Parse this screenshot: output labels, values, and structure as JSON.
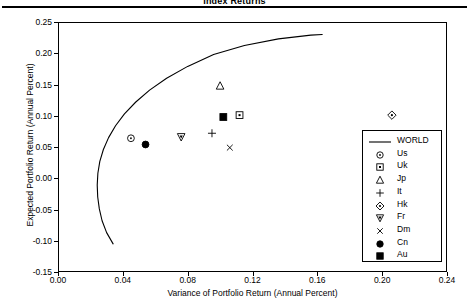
{
  "header": {
    "title": "Index Returns",
    "rule": true
  },
  "chart_data": {
    "type": "scatter",
    "title": "Index Returns",
    "xlabel": "Variance of Portfolio Return (Annual Percent)",
    "ylabel": "Expected Portfolio Return (Annual Percent)",
    "xlim": [
      0.0,
      0.24
    ],
    "ylim": [
      -0.15,
      0.25
    ],
    "xticks": [
      "0.00",
      "0.04",
      "0.08",
      "0.12",
      "0.16",
      "0.20",
      "0.24"
    ],
    "xtick_values": [
      0.0,
      0.04,
      0.08,
      0.12,
      0.16,
      0.2,
      0.24
    ],
    "yticks": [
      "0.25",
      "0.20",
      "0.15",
      "0.10",
      "0.05",
      "0.00",
      "-0.05",
      "-0.10",
      "-0.15"
    ],
    "ytick_values": [
      0.25,
      0.2,
      0.15,
      0.1,
      0.05,
      0.0,
      -0.05,
      -0.1,
      -0.15
    ],
    "grid": false,
    "legend_position": "right-inside",
    "series": [
      {
        "name": "WORLD",
        "marker": "line",
        "type": "curve",
        "note": "efficient frontier hyperbola",
        "points": [
          [
            0.034,
            -0.105
          ],
          [
            0.03,
            -0.087
          ],
          [
            0.0272,
            -0.068
          ],
          [
            0.0255,
            -0.049
          ],
          [
            0.0245,
            -0.03
          ],
          [
            0.0242,
            -0.011
          ],
          [
            0.0246,
            0.008
          ],
          [
            0.0258,
            0.027
          ],
          [
            0.028,
            0.046
          ],
          [
            0.0312,
            0.065
          ],
          [
            0.0355,
            0.084
          ],
          [
            0.041,
            0.103
          ],
          [
            0.048,
            0.122
          ],
          [
            0.0565,
            0.141
          ],
          [
            0.067,
            0.16
          ],
          [
            0.08,
            0.179
          ],
          [
            0.096,
            0.198
          ],
          [
            0.115,
            0.2125
          ],
          [
            0.136,
            0.223
          ],
          [
            0.156,
            0.229
          ],
          [
            0.163,
            0.23
          ]
        ]
      },
      {
        "name": "Us",
        "marker": "circle-dot",
        "x": 0.045,
        "y": 0.064
      },
      {
        "name": "Uk",
        "marker": "square-dot",
        "x": 0.112,
        "y": 0.101
      },
      {
        "name": "Jp",
        "marker": "triangle-up",
        "x": 0.1,
        "y": 0.148
      },
      {
        "name": "It",
        "marker": "plus",
        "x": 0.095,
        "y": 0.072
      },
      {
        "name": "Hk",
        "marker": "diamond-dot",
        "x": 0.206,
        "y": 0.101
      },
      {
        "name": "Fr",
        "marker": "triangle-down-dot",
        "x": 0.076,
        "y": 0.066
      },
      {
        "name": "Dm",
        "marker": "cross",
        "x": 0.106,
        "y": 0.049
      },
      {
        "name": "Cn",
        "marker": "filled-circle",
        "x": 0.054,
        "y": 0.054
      },
      {
        "name": "Au",
        "marker": "filled-square",
        "x": 0.102,
        "y": 0.098
      }
    ],
    "legend_entries": [
      {
        "label": "WORLD",
        "marker": "line"
      },
      {
        "label": "Us",
        "marker": "circle-dot"
      },
      {
        "label": "Uk",
        "marker": "square-dot"
      },
      {
        "label": "Jp",
        "marker": "triangle-up"
      },
      {
        "label": "It",
        "marker": "plus"
      },
      {
        "label": "Hk",
        "marker": "diamond-dot"
      },
      {
        "label": "Fr",
        "marker": "triangle-down-dot"
      },
      {
        "label": "Dm",
        "marker": "cross"
      },
      {
        "label": "Cn",
        "marker": "filled-circle"
      },
      {
        "label": "Au",
        "marker": "filled-square"
      }
    ],
    "colors": {
      "ink": "#000000",
      "background": "#ffffff"
    }
  }
}
